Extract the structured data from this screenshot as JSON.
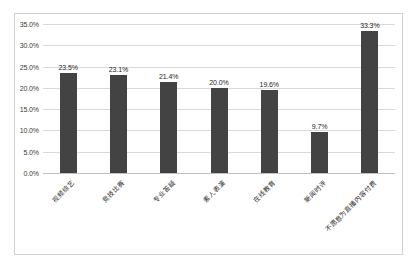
{
  "chart_data": {
    "type": "bar",
    "title": "",
    "subtitle": "",
    "xlabel": "",
    "ylabel": "",
    "categories": [
      "视频综艺",
      "竞技比赛",
      "专业答疑",
      "素人表演",
      "在线教育",
      "新闻时评",
      "不愿意为直播内容付费"
    ],
    "values": [
      23.5,
      23.1,
      21.4,
      20.0,
      19.6,
      9.7,
      33.3
    ],
    "value_labels": [
      "23.5%",
      "23.1%",
      "21.4%",
      "20.0%",
      "19.6%",
      "9.7%",
      "33.3%"
    ],
    "ylim": [
      0,
      35
    ],
    "ytick_values": [
      0,
      5,
      10,
      15,
      20,
      25,
      30,
      35
    ],
    "ytick_labels": [
      "0.0%",
      "5.0%",
      "10.0%",
      "15.0%",
      "20.0%",
      "25.0%",
      "30.0%",
      "35.0%"
    ],
    "grid": true,
    "legend": "none",
    "series_color": "#434343",
    "gridline_color": "#d9d9d9",
    "frame_color": "#d2d2d2",
    "background_color": "#ffffff"
  }
}
